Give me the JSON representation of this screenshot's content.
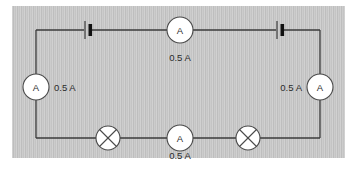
{
  "figure": {
    "kind": "circuit-diagram",
    "panel_color": "#c8c8c8",
    "wire_color": "#3b3b3b",
    "component_fill": "#ffffff"
  },
  "ammeters": [
    {
      "id": "top-center",
      "symbol": "A",
      "reading": "0.5 A",
      "label_position": "below"
    },
    {
      "id": "left",
      "symbol": "A",
      "reading": "0.5 A",
      "label_position": "right"
    },
    {
      "id": "right",
      "symbol": "A",
      "reading": "0.5 A",
      "label_position": "left"
    },
    {
      "id": "bottom-center",
      "symbol": "A",
      "reading": "0.5 A",
      "label_position": "below"
    }
  ],
  "lamps": [
    {
      "id": "lamp-left",
      "symbol": "crossed-circle"
    },
    {
      "id": "lamp-right",
      "symbol": "crossed-circle"
    }
  ],
  "cells": [
    {
      "id": "cell-top-left",
      "symbol": "battery-cell"
    },
    {
      "id": "cell-top-right",
      "symbol": "battery-cell"
    }
  ]
}
